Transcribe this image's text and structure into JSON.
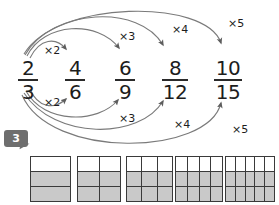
{
  "page": {
    "exercise_number": "3"
  },
  "fractions": [
    {
      "numerator": "2",
      "denominator": "3",
      "left": 8,
      "top": 58,
      "bar_width": 20
    },
    {
      "numerator": "4",
      "denominator": "6",
      "left": 55,
      "top": 58,
      "bar_width": 20
    },
    {
      "numerator": "6",
      "denominator": "9",
      "left": 105,
      "top": 58,
      "bar_width": 20
    },
    {
      "numerator": "8",
      "denominator": "12",
      "left": 155,
      "top": 58,
      "bar_width": 26
    },
    {
      "numerator": "10",
      "denominator": "15",
      "left": 208,
      "top": 58,
      "bar_width": 28
    }
  ],
  "multiplier_labels": {
    "top": [
      {
        "text": "×2",
        "left": 44,
        "top": 44
      },
      {
        "text": "×3",
        "left": 119,
        "top": 30
      },
      {
        "text": "×4",
        "left": 172,
        "top": 23
      },
      {
        "text": "×5",
        "left": 228,
        "top": 17
      }
    ],
    "bottom": [
      {
        "text": "×2",
        "left": 44,
        "top": 96
      },
      {
        "text": "×3",
        "left": 119,
        "top": 112
      },
      {
        "text": "×4",
        "left": 174,
        "top": 118
      },
      {
        "text": "×5",
        "left": 232,
        "top": 123
      }
    ]
  },
  "arrows": {
    "stroke_color": "#7a7a7a",
    "stroke_width": 1.1,
    "top_paths": [
      "M 30,58 C 40,38 56,37 66,49",
      "M 27,56 C 44,22 98,20 119,48",
      "M 25,55 C 52,8 140,4 163,45",
      "M 24,54 C 56,0 206,-2 221,43"
    ],
    "bottom_paths": [
      "M 30,89 C 38,108 54,110 66,99",
      "M 26,91 C 44,124 98,124 118,100",
      "M 24,93 C 54,140 140,140 163,101",
      "M 22,95 C 50,160 208,156 221,103"
    ]
  },
  "grids": {
    "rows": 3,
    "shaded_rows_from_bottom": 2,
    "shade_color": "#c9c9c9",
    "line_color": "#3a3a3a",
    "items": [
      {
        "columns": 1,
        "left": 30,
        "width": 41,
        "height": 46,
        "fraction": "2/3",
        "shaded_cells": 2,
        "total_cells": 3
      },
      {
        "columns": 2,
        "left": 77,
        "width": 44,
        "height": 46,
        "fraction": "4/6",
        "shaded_cells": 4,
        "total_cells": 6
      },
      {
        "columns": 3,
        "left": 126,
        "width": 47,
        "height": 46,
        "fraction": "6/9",
        "shaded_cells": 6,
        "total_cells": 9
      },
      {
        "columns": 4,
        "left": 175,
        "width": 48,
        "height": 46,
        "fraction": "8/12",
        "shaded_cells": 8,
        "total_cells": 12
      },
      {
        "columns": 5,
        "left": 225,
        "width": 50,
        "height": 46,
        "fraction": "10/15",
        "shaded_cells": 10,
        "total_cells": 15
      }
    ]
  },
  "chart_data": {
    "type": "diagram",
    "sequence": [
      "2/3",
      "4/6",
      "6/9",
      "8/12",
      "10/15"
    ],
    "multipliers": [
      "×2",
      "×3",
      "×4",
      "×5"
    ],
    "note": "Numerator and denominator of 2/3 are each multiplied by 2, 3, 4 and 5 to give the equivalent fractions; each area model below shows 3 rows with the lower 2 rows shaded."
  }
}
